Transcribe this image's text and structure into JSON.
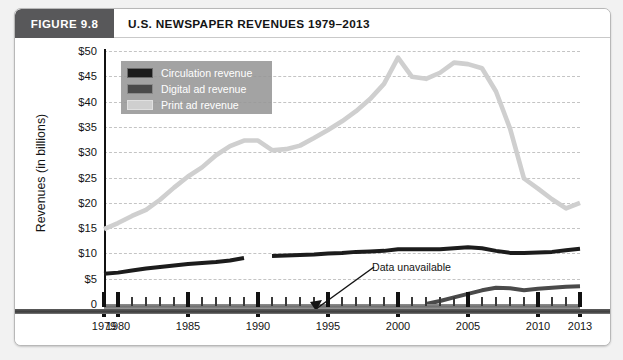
{
  "figure": {
    "tab_label": "FIGURE 9.8",
    "title": "U.S. NEWSPAPER REVENUES 1979–2013"
  },
  "axes": {
    "ylabel": "Revenues (in billions)",
    "ytick_labels": [
      "$50",
      "$45",
      "$40",
      "$35",
      "$30",
      "$25",
      "$20",
      "$15",
      "$10",
      "$5",
      "0"
    ],
    "ytick_values": [
      50,
      45,
      40,
      35,
      30,
      25,
      20,
      15,
      10,
      5,
      0
    ],
    "ylim": [
      0,
      50
    ],
    "xlim": [
      1979,
      2013
    ],
    "xtick_labels": [
      "1979",
      "1980",
      "1985",
      "1990",
      "1995",
      "2000",
      "2005",
      "2010",
      "2013"
    ],
    "xtick_values": [
      1979,
      1980,
      1985,
      1990,
      1995,
      2000,
      2005,
      2010,
      2013
    ]
  },
  "legend": {
    "position": "top-left-inside",
    "items": [
      {
        "label": "Circulation revenue",
        "color": "#1c1c1c"
      },
      {
        "label": "Digital ad revenue",
        "color": "#4a4a4a"
      },
      {
        "label": "Print ad revenue",
        "color": "#cfcfcf"
      }
    ]
  },
  "annotations": [
    {
      "text": "Data unavailable",
      "points_to_year": 1990,
      "points_to_value": 9.2
    }
  ],
  "chart_data": {
    "type": "line",
    "title": "U.S. NEWSPAPER REVENUES 1979–2013",
    "xlabel": "",
    "ylabel": "Revenues (in billions)",
    "xlim": [
      1979,
      2013
    ],
    "ylim": [
      0,
      50
    ],
    "grid": "horizontal-dashed",
    "legend_position": "top-left-inside",
    "x": [
      1979,
      1980,
      1981,
      1982,
      1983,
      1984,
      1985,
      1986,
      1987,
      1988,
      1989,
      1990,
      1991,
      1992,
      1993,
      1994,
      1995,
      1996,
      1997,
      1998,
      1999,
      2000,
      2001,
      2002,
      2003,
      2004,
      2005,
      2006,
      2007,
      2008,
      2009,
      2010,
      2011,
      2012,
      2013
    ],
    "series": [
      {
        "name": "Print ad revenue",
        "color": "#cfcfcf",
        "values": [
          14.8,
          16.0,
          17.4,
          18.6,
          20.6,
          23.0,
          25.2,
          27.0,
          29.4,
          31.2,
          32.3,
          32.3,
          30.4,
          30.6,
          31.3,
          32.8,
          34.4,
          36.1,
          38.1,
          40.5,
          43.5,
          48.7,
          44.9,
          44.5,
          45.7,
          47.7,
          47.4,
          46.6,
          42.0,
          34.7,
          24.8,
          22.8,
          20.7,
          18.9,
          20.0
        ]
      },
      {
        "name": "Circulation revenue",
        "color": "#1c1c1c",
        "values": [
          6.0,
          6.2,
          6.6,
          7.0,
          7.3,
          7.6,
          7.9,
          8.1,
          8.3,
          8.6,
          9.1,
          null,
          9.5,
          9.6,
          9.7,
          9.8,
          10.0,
          10.1,
          10.3,
          10.4,
          10.5,
          10.8,
          10.8,
          10.8,
          10.8,
          11.0,
          11.2,
          11.0,
          10.5,
          10.1,
          10.1,
          10.2,
          10.3,
          10.6,
          10.9
        ]
      },
      {
        "name": "Digital ad revenue",
        "color": "#4a4a4a",
        "values": [
          null,
          null,
          null,
          null,
          null,
          null,
          null,
          null,
          null,
          null,
          null,
          null,
          null,
          null,
          null,
          null,
          null,
          null,
          null,
          null,
          null,
          null,
          null,
          0.0,
          0.6,
          1.3,
          2.0,
          2.7,
          3.2,
          3.1,
          2.7,
          3.0,
          3.2,
          3.4,
          3.5
        ]
      }
    ],
    "notes": [
      {
        "text": "Data unavailable",
        "year": 1990
      }
    ]
  }
}
